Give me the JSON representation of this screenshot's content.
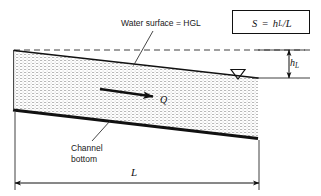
{
  "figure": {
    "type": "open-channel-flow-schematic",
    "background_color": "#ffffff",
    "line_color": "#111111",
    "water_fill_pattern": "stipple"
  },
  "labels": {
    "water_surface": "Water surface = HGL",
    "channel_bottom_line1": "Channel",
    "channel_bottom_line2": "bottom",
    "discharge": "Q",
    "head_loss": "h",
    "head_loss_sub": "L",
    "length": "L"
  },
  "formula": {
    "lhs": "S",
    "equals": "=",
    "numerator": "h",
    "numerator_sub": "L",
    "divider": "/",
    "denominator": "L",
    "full_text": "S = hL/L"
  },
  "geometry": {
    "hgl_datum_y": 50,
    "water_surface_start": [
      14,
      51
    ],
    "water_surface_end": [
      258,
      78
    ],
    "channel_bottom_start": [
      13,
      110
    ],
    "channel_bottom_end": [
      258,
      138
    ],
    "length_dimension_x": [
      15,
      259
    ],
    "length_dimension_y": 183,
    "head_loss_dimension_x": 289,
    "head_loss_dimension_y": [
      50,
      78
    ]
  },
  "annotations": {
    "water_triangle_symbol": "inverted-triangle",
    "flow_direction": "left-to-right"
  }
}
